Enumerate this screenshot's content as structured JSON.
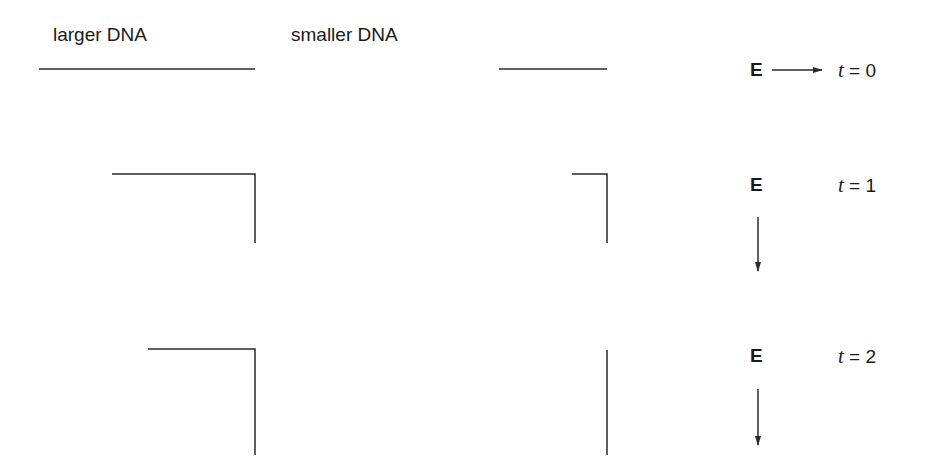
{
  "headers": {
    "larger": "larger DNA",
    "smaller": "smaller DNA"
  },
  "field_label": "E",
  "rows": [
    {
      "t_var": "t",
      "t_eq": " = 0",
      "field_direction": "right"
    },
    {
      "t_var": "t",
      "t_eq": " = 1",
      "field_direction": "down"
    },
    {
      "t_var": "t",
      "t_eq": " = 2",
      "field_direction": "down"
    }
  ],
  "colors": {
    "line": "#2a2a2a",
    "text": "#1a1a1a",
    "background": "#ffffff"
  }
}
